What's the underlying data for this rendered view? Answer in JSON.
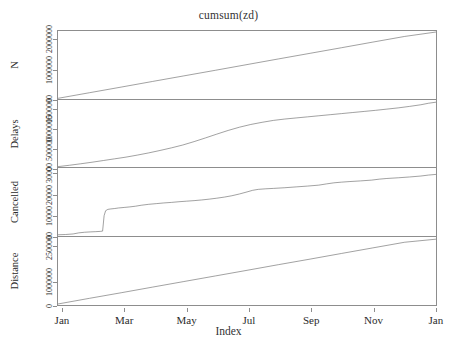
{
  "chart_data": {
    "type": "line",
    "title": "cumsum(zd)",
    "xlabel": "Index",
    "ylabel": "",
    "grid": false,
    "legend": "none",
    "layout": "stacked multi-panel time series (R plot.ts / cumsum)",
    "x": [
      "Jan",
      "Mar",
      "May",
      "Jul",
      "Sep",
      "Nov",
      "Jan"
    ],
    "xtick_labels": [
      "Jan",
      "Mar",
      "May",
      "Jul",
      "Sep",
      "Nov",
      "Jan"
    ],
    "xtick_positions": [
      0.013,
      0.177,
      0.341,
      0.505,
      0.669,
      0.833,
      0.997
    ],
    "panels": [
      {
        "name": "N",
        "label": "N",
        "ylim": [
          0,
          2300000
        ],
        "ytick_labels": [
          "0",
          "1000000",
          "2000000"
        ],
        "ytick_values": [
          0,
          1000000,
          2000000
        ],
        "series_name": "N",
        "shape": "straight increasing line (constant daily counts)",
        "points": [
          [
            0.0,
            0.01
          ],
          [
            0.083,
            0.092
          ],
          [
            0.167,
            0.175
          ],
          [
            0.25,
            0.258
          ],
          [
            0.333,
            0.34
          ],
          [
            0.417,
            0.423
          ],
          [
            0.5,
            0.506
          ],
          [
            0.583,
            0.589
          ],
          [
            0.667,
            0.672
          ],
          [
            0.75,
            0.754
          ],
          [
            0.833,
            0.837
          ],
          [
            0.917,
            0.92
          ],
          [
            1.0,
            0.985
          ]
        ]
      },
      {
        "name": "Delays",
        "label": "Delays",
        "ylim": [
          0,
          1750000
        ],
        "ytick_labels": [
          "0",
          "500000",
          "1000000",
          "1500000"
        ],
        "ytick_values": [
          0,
          500000,
          1000000,
          1500000
        ],
        "series_name": "Delays",
        "shape": "S-shaped / sigmoidal cumulative curve, steep rise spring-summer then concave",
        "points": [
          [
            0.0,
            0.02
          ],
          [
            0.03,
            0.04
          ],
          [
            0.06,
            0.062
          ],
          [
            0.09,
            0.085
          ],
          [
            0.12,
            0.11
          ],
          [
            0.15,
            0.135
          ],
          [
            0.18,
            0.16
          ],
          [
            0.21,
            0.19
          ],
          [
            0.24,
            0.222
          ],
          [
            0.27,
            0.258
          ],
          [
            0.3,
            0.296
          ],
          [
            0.33,
            0.338
          ],
          [
            0.36,
            0.388
          ],
          [
            0.39,
            0.442
          ],
          [
            0.42,
            0.498
          ],
          [
            0.45,
            0.552
          ],
          [
            0.48,
            0.6
          ],
          [
            0.51,
            0.64
          ],
          [
            0.54,
            0.672
          ],
          [
            0.57,
            0.7
          ],
          [
            0.6,
            0.72
          ],
          [
            0.63,
            0.736
          ],
          [
            0.66,
            0.752
          ],
          [
            0.69,
            0.768
          ],
          [
            0.72,
            0.784
          ],
          [
            0.75,
            0.8
          ],
          [
            0.78,
            0.816
          ],
          [
            0.81,
            0.832
          ],
          [
            0.84,
            0.848
          ],
          [
            0.87,
            0.866
          ],
          [
            0.9,
            0.884
          ],
          [
            0.93,
            0.906
          ],
          [
            0.96,
            0.93
          ],
          [
            0.98,
            0.952
          ],
          [
            1.0,
            0.968
          ]
        ]
      },
      {
        "name": "Cancelled",
        "label": "Cancelled",
        "ylim": [
          0,
          33000
        ],
        "ytick_labels": [
          "0",
          "10000",
          "20000",
          "30000"
        ],
        "ytick_values": [
          0,
          10000,
          20000,
          30000
        ],
        "series_name": "Cancelled",
        "shape": "flat start, abrupt vertical jump in early February (storm), then steady climb",
        "points": [
          [
            0.0,
            0.018
          ],
          [
            0.02,
            0.022
          ],
          [
            0.04,
            0.03
          ],
          [
            0.055,
            0.046
          ],
          [
            0.07,
            0.055
          ],
          [
            0.085,
            0.06
          ],
          [
            0.1,
            0.064
          ],
          [
            0.112,
            0.068
          ],
          [
            0.118,
            0.072
          ],
          [
            0.122,
            0.3
          ],
          [
            0.126,
            0.372
          ],
          [
            0.132,
            0.392
          ],
          [
            0.14,
            0.398
          ],
          [
            0.15,
            0.404
          ],
          [
            0.16,
            0.412
          ],
          [
            0.175,
            0.42
          ],
          [
            0.19,
            0.428
          ],
          [
            0.205,
            0.438
          ],
          [
            0.22,
            0.452
          ],
          [
            0.24,
            0.466
          ],
          [
            0.26,
            0.476
          ],
          [
            0.28,
            0.486
          ],
          [
            0.3,
            0.494
          ],
          [
            0.32,
            0.504
          ],
          [
            0.34,
            0.512
          ],
          [
            0.36,
            0.52
          ],
          [
            0.38,
            0.53
          ],
          [
            0.4,
            0.542
          ],
          [
            0.42,
            0.556
          ],
          [
            0.44,
            0.572
          ],
          [
            0.46,
            0.592
          ],
          [
            0.48,
            0.618
          ],
          [
            0.5,
            0.648
          ],
          [
            0.515,
            0.672
          ],
          [
            0.53,
            0.686
          ],
          [
            0.55,
            0.694
          ],
          [
            0.57,
            0.7
          ],
          [
            0.6,
            0.71
          ],
          [
            0.63,
            0.722
          ],
          [
            0.66,
            0.734
          ],
          [
            0.69,
            0.748
          ],
          [
            0.71,
            0.766
          ],
          [
            0.73,
            0.782
          ],
          [
            0.75,
            0.792
          ],
          [
            0.77,
            0.8
          ],
          [
            0.8,
            0.81
          ],
          [
            0.83,
            0.822
          ],
          [
            0.85,
            0.836
          ],
          [
            0.87,
            0.846
          ],
          [
            0.9,
            0.856
          ],
          [
            0.93,
            0.868
          ],
          [
            0.96,
            0.882
          ],
          [
            0.98,
            0.896
          ],
          [
            1.0,
            0.906
          ]
        ]
      },
      {
        "name": "Distance",
        "label": "Distance",
        "ylim": [
          0,
          2900000
        ],
        "ytick_labels": [
          "0",
          "1000000",
          "2500000"
        ],
        "ytick_values": [
          0,
          1000000,
          2500000
        ],
        "series_name": "Distance",
        "shape": "straight increasing line (constant daily distance flown)",
        "points": [
          [
            0.0,
            0.015
          ],
          [
            0.083,
            0.098
          ],
          [
            0.167,
            0.18
          ],
          [
            0.25,
            0.263
          ],
          [
            0.333,
            0.345
          ],
          [
            0.417,
            0.428
          ],
          [
            0.5,
            0.51
          ],
          [
            0.583,
            0.593
          ],
          [
            0.667,
            0.675
          ],
          [
            0.75,
            0.758
          ],
          [
            0.833,
            0.84
          ],
          [
            0.917,
            0.923
          ],
          [
            1.0,
            0.968
          ]
        ]
      }
    ],
    "colors": {
      "line": "#555555",
      "frame": "#8d8d8d",
      "text": "#2b2b2b",
      "background": "#ffffff"
    }
  }
}
